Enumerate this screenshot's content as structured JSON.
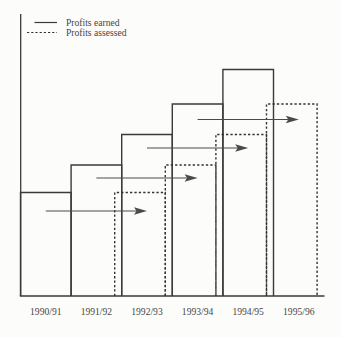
{
  "figure": {
    "background_color": "#fcfcfa",
    "line_color": "#3a3a3a",
    "arrow_color": "#4a4a4a",
    "text_color": "#474747"
  },
  "chart_data": {
    "type": "bar",
    "title": "",
    "xlabel": "",
    "ylabel": "",
    "categories": [
      "1990/91",
      "1991/92",
      "1992/93",
      "1993/94",
      "1994/95",
      "1995/96"
    ],
    "series": [
      {
        "name": "Profits earned",
        "line_style": "solid",
        "values": [
          103.5,
          131,
          161.5,
          192,
          226.5,
          null
        ]
      },
      {
        "name": "Profits assessed",
        "line_style": "dashed",
        "values": [
          null,
          null,
          103.5,
          131,
          161.5,
          192
        ]
      }
    ],
    "value_axis": {
      "range": [
        0,
        282
      ],
      "tick_labels_shown": false
    },
    "grid": false,
    "legend_position": "top-left",
    "lag_arrows": [
      {
        "from": "1990/91",
        "to": "1992/93",
        "height": 85
      },
      {
        "from": "1991/92",
        "to": "1993/94",
        "height": 118
      },
      {
        "from": "1992/93",
        "to": "1994/95",
        "height": 148
      },
      {
        "from": "1993/94",
        "to": "1995/96",
        "height": 176.5
      }
    ]
  }
}
